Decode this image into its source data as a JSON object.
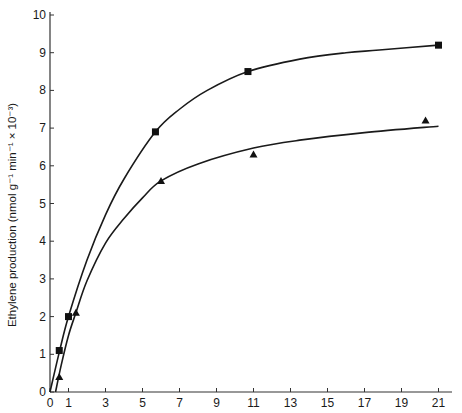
{
  "chart_data": {
    "type": "scatter",
    "title": "",
    "xlabel": "",
    "ylabel": "Ethylene production (nmol g⁻¹ min⁻¹ × 10⁻³)",
    "xlim": [
      0,
      22
    ],
    "ylim": [
      0,
      10
    ],
    "grid": false,
    "legend": null,
    "x_ticks": [
      0,
      1,
      3,
      5,
      7,
      9,
      11,
      13,
      15,
      17,
      19,
      21
    ],
    "y_ticks": [
      0,
      1,
      2,
      3,
      4,
      5,
      6,
      7,
      8,
      9,
      10
    ],
    "series": [
      {
        "name": "squares",
        "marker": "square",
        "points": [
          {
            "x": 0.5,
            "y": 1.1
          },
          {
            "x": 1.0,
            "y": 2.0
          },
          {
            "x": 5.7,
            "y": 6.9
          },
          {
            "x": 10.7,
            "y": 8.5
          },
          {
            "x": 21.0,
            "y": 9.2
          }
        ],
        "fit_curve": [
          [
            0,
            0
          ],
          [
            0.5,
            1.05
          ],
          [
            1,
            2.0
          ],
          [
            2,
            3.5
          ],
          [
            3,
            4.7
          ],
          [
            4,
            5.65
          ],
          [
            5.7,
            6.9
          ],
          [
            7,
            7.5
          ],
          [
            8.5,
            8.0
          ],
          [
            10.7,
            8.5
          ],
          [
            13.5,
            8.83
          ],
          [
            16,
            9.0
          ],
          [
            17.8,
            9.07
          ],
          [
            21,
            9.2
          ]
        ]
      },
      {
        "name": "triangles",
        "marker": "triangle",
        "points": [
          {
            "x": 0.5,
            "y": 0.4
          },
          {
            "x": 1.4,
            "y": 2.1
          },
          {
            "x": 6.0,
            "y": 5.6
          },
          {
            "x": 11.0,
            "y": 6.3
          },
          {
            "x": 20.3,
            "y": 7.2
          }
        ],
        "fit_curve": [
          [
            0.3,
            0
          ],
          [
            0.6,
            0.7
          ],
          [
            1,
            1.5
          ],
          [
            1.4,
            2.1
          ],
          [
            2,
            2.95
          ],
          [
            3,
            3.95
          ],
          [
            4,
            4.6
          ],
          [
            5,
            5.15
          ],
          [
            6,
            5.6
          ],
          [
            8,
            6.05
          ],
          [
            11,
            6.47
          ],
          [
            13.5,
            6.68
          ],
          [
            17,
            6.88
          ],
          [
            21,
            7.05
          ]
        ]
      }
    ]
  },
  "axes": {
    "x_tick_labels": [
      "0",
      "1",
      "3",
      "5",
      "7",
      "9",
      "11",
      "13",
      "15",
      "17",
      "19",
      "21"
    ],
    "y_tick_labels": [
      "0",
      "1",
      "2",
      "3",
      "4",
      "5",
      "6",
      "7",
      "8",
      "9",
      "10"
    ],
    "ylabel": "Ethylene production (nmol g⁻¹ min⁻¹ × 10⁻³)"
  }
}
